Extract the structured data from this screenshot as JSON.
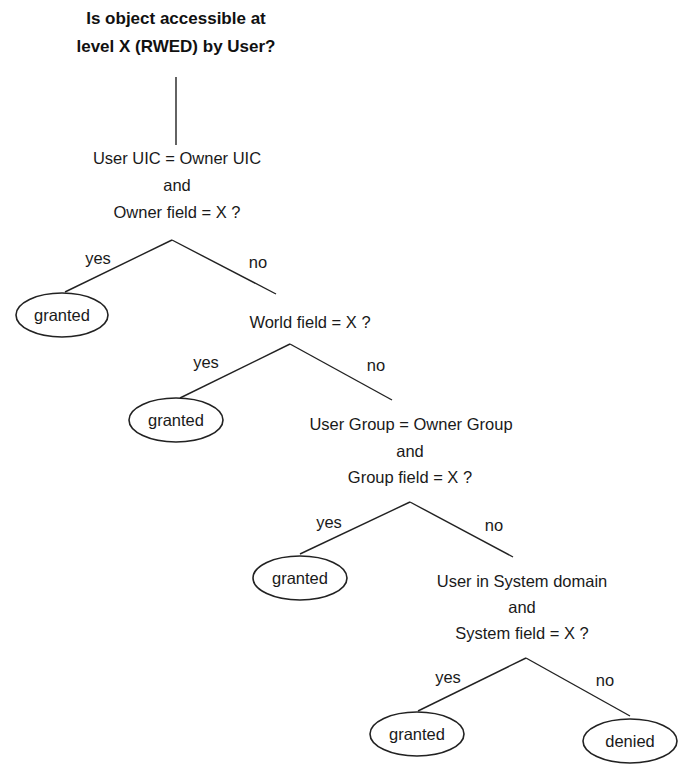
{
  "title": {
    "line1": "Is object accessible at",
    "line2": "level X (RWED) by User?"
  },
  "decisions": [
    {
      "lines": [
        "User UIC = Owner UIC",
        "and",
        "Owner field = X ?"
      ]
    },
    {
      "lines": [
        "World field = X ?"
      ]
    },
    {
      "lines": [
        "User Group = Owner Group",
        "and",
        "Group field = X ?"
      ]
    },
    {
      "lines": [
        "User in System domain",
        "and",
        "System field = X ?"
      ]
    }
  ],
  "branch_labels": {
    "yes": "yes",
    "no": "no"
  },
  "outcomes": {
    "granted": "granted",
    "denied": "denied"
  }
}
